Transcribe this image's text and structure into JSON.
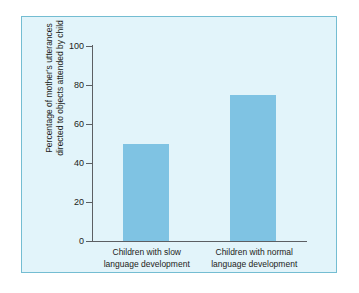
{
  "chart_data": {
    "type": "bar",
    "title": "",
    "xlabel": "",
    "ylabel": "Percentage of mother's utterances directed to objects attended by child",
    "ylabel_lines": [
      "Percentage of mother's utterances",
      "directed to objects attended by child"
    ],
    "categories": [
      "Children with slow language development",
      "Children with normal language development"
    ],
    "category_lines": [
      [
        "Children with slow",
        "language development"
      ],
      [
        "Children with normal",
        "language development"
      ]
    ],
    "values": [
      50,
      75
    ],
    "ylim": [
      0,
      100
    ],
    "yticks": [
      0,
      20,
      40,
      60,
      80,
      100
    ],
    "ytick_labels": [
      "0",
      "20",
      "40",
      "60",
      "80",
      "100"
    ],
    "grid": false,
    "legend": null,
    "bar_color": "#7fc3e3",
    "panel_background": "#e2f4fa",
    "panel_border_color": "#74bdd2",
    "axis_color": "#5c5f63",
    "text_color": "#1c1d20",
    "page_background": "#ffffff"
  }
}
